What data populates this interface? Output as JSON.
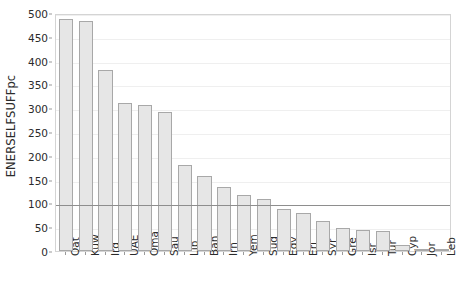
{
  "chart_data": {
    "type": "bar",
    "title": "",
    "xlabel": "",
    "ylabel": "ENERSELFSUFFpc",
    "ylim": [
      0,
      500
    ],
    "yticks": [
      0,
      50,
      100,
      150,
      200,
      250,
      300,
      350,
      400,
      450,
      500
    ],
    "ytick_labels": [
      "0",
      "50",
      "100",
      "150",
      "200",
      "250",
      "300",
      "350",
      "400",
      "450",
      "500"
    ],
    "grid": false,
    "legend": "none",
    "reference_line": {
      "value": 100,
      "label": "",
      "color": "#8e8e8e"
    },
    "bar_color": "#e6e6e6",
    "bar_edge_color": "#a8a8a8",
    "categories": [
      "Qat",
      "Kuw",
      "Irq",
      "UAE",
      "Oma",
      "Sau",
      "Lib",
      "Bah",
      "Irn",
      "Yem",
      "Sud",
      "Egy",
      "Eri",
      "Syr",
      "Gre",
      "Isr",
      "Tur",
      "Cyp",
      "Jor",
      "Leb"
    ],
    "values": [
      487,
      484,
      380,
      311,
      307,
      292,
      180,
      157,
      135,
      117,
      109,
      88,
      79,
      63,
      48,
      44,
      42,
      12,
      5,
      2
    ]
  }
}
